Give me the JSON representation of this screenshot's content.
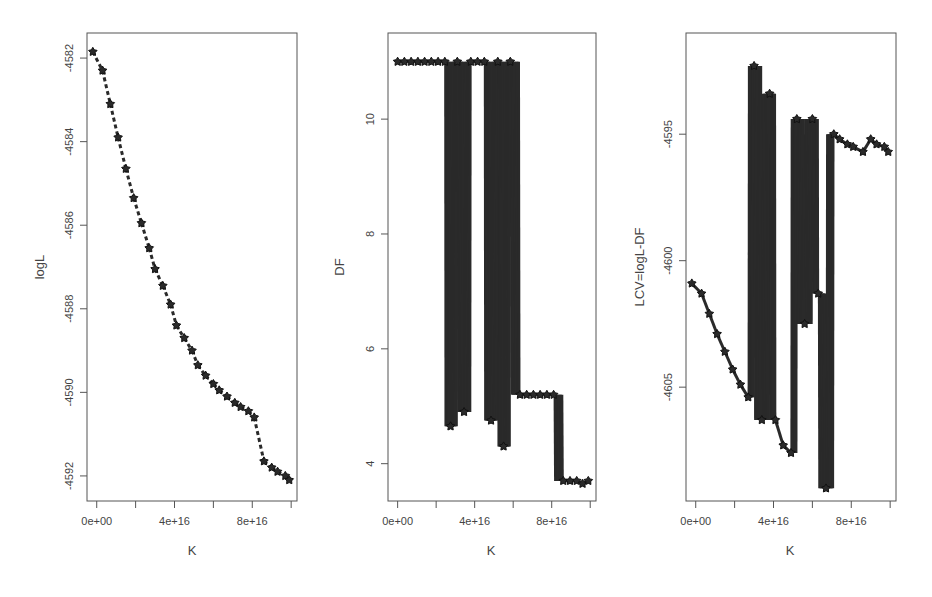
{
  "figure": {
    "background": "#ffffff",
    "line_color": "#2a2a2a",
    "marker_color": "#2a2a2a",
    "frame_color": "#555555"
  },
  "chart_data": [
    {
      "type": "line",
      "panel": "left",
      "title": "",
      "xlabel": "K",
      "ylabel": "logL",
      "x_ticks": [
        0,
        2e+16,
        4e+16,
        6e+16,
        8e+16,
        1e+17
      ],
      "x_tick_labels": [
        "0e+00",
        "",
        "4e+16",
        "",
        "8e+16",
        ""
      ],
      "y_ticks": [
        -4582,
        -4584,
        -4586,
        -4588,
        -4590,
        -4592
      ],
      "y_tick_labels": [
        "-4582",
        "-4584",
        "-4586",
        "-4588",
        "-4590",
        "-4592"
      ],
      "xlim": [
        -5000000000000000.0,
        1.03e+17
      ],
      "ylim": [
        -4592.6,
        -4581.4
      ],
      "grid": false,
      "x": [
        -2000000000000000.0,
        3000000000000000.0,
        7000000000000000.0,
        1.1e+16,
        1.5e+16,
        1.9e+16,
        2.3e+16,
        2.7e+16,
        3e+16,
        3.4e+16,
        3.8e+16,
        4.1e+16,
        4.5e+16,
        4.9e+16,
        5.2e+16,
        5.6e+16,
        6e+16,
        6.3e+16,
        6.7e+16,
        7.1e+16,
        7.4e+16,
        7.8e+16,
        8.1e+16,
        8.6e+16,
        9e+16,
        9.3e+16,
        9.7e+16,
        9.9e+16
      ],
      "y": [
        -4581.85,
        -4582.3,
        -4583.1,
        -4583.9,
        -4584.65,
        -4585.35,
        -4585.95,
        -4586.55,
        -4587.05,
        -4587.45,
        -4587.9,
        -4588.4,
        -4588.7,
        -4589.0,
        -4589.35,
        -4589.6,
        -4589.8,
        -4589.95,
        -4590.1,
        -4590.25,
        -4590.35,
        -4590.45,
        -4590.6,
        -4591.65,
        -4591.8,
        -4591.9,
        -4592.0,
        -4592.1
      ],
      "marker": "star",
      "linestyle": "dashed"
    },
    {
      "type": "line",
      "panel": "middle",
      "title": "",
      "xlabel": "K",
      "ylabel": "DF",
      "x_ticks": [
        0,
        2e+16,
        4e+16,
        6e+16,
        8e+16,
        1e+17
      ],
      "x_tick_labels": [
        "0e+00",
        "",
        "4e+16",
        "",
        "8e+16",
        ""
      ],
      "y_ticks": [
        4,
        6,
        8,
        10
      ],
      "y_tick_labels": [
        "4",
        "6",
        "8",
        "10"
      ],
      "xlim": [
        -5000000000000000.0,
        1.03e+17
      ],
      "ylim": [
        3.35,
        11.5
      ],
      "grid": false,
      "x": [
        0,
        3500000000000000.0,
        7000000000000000.0,
        1.05e+16,
        1.4e+16,
        1.75e+16,
        2.1e+16,
        2.45e+16,
        2.75e+16,
        3.1e+16,
        3.45e+16,
        3.8e+16,
        4.15e+16,
        4.5e+16,
        4.85e+16,
        5.2e+16,
        5.5e+16,
        5.85e+16,
        6.35e+16,
        6.7e+16,
        7.05e+16,
        7.4e+16,
        7.75e+16,
        8.1e+16,
        8.6e+16,
        8.95e+16,
        9.3e+16,
        9.6e+16,
        9.9e+16
      ],
      "y": [
        11.0,
        11.0,
        11.0,
        11.0,
        11.0,
        11.0,
        11.0,
        11.0,
        4.65,
        11.0,
        4.9,
        11.0,
        11.0,
        11.0,
        4.75,
        11.0,
        4.3,
        11.0,
        5.2,
        5.2,
        5.2,
        5.2,
        5.2,
        5.2,
        3.7,
        3.7,
        3.7,
        3.65,
        3.7
      ],
      "marker": "star",
      "linestyle": "solid-oscillating"
    },
    {
      "type": "line",
      "panel": "right",
      "title": "",
      "xlabel": "K",
      "ylabel": "LCV=logL-DF",
      "x_ticks": [
        0,
        2e+16,
        4e+16,
        6e+16,
        8e+16,
        1e+17
      ],
      "x_tick_labels": [
        "0e+00",
        "",
        "4e+16",
        "",
        "8e+16",
        ""
      ],
      "y_ticks": [
        -4595,
        -4600,
        -4605
      ],
      "y_tick_labels": [
        "-4595",
        "-4600",
        "-4605"
      ],
      "xlim": [
        -5000000000000000.0,
        1.03e+17
      ],
      "ylim": [
        -4609.5,
        -4591
      ],
      "grid": false,
      "x": [
        -2000000000000000.0,
        3000000000000000.0,
        7000000000000000.0,
        1.1e+16,
        1.5e+16,
        1.9e+16,
        2.3e+16,
        2.7e+16,
        3e+16,
        3.4e+16,
        3.8e+16,
        4.1e+16,
        4.5e+16,
        4.9e+16,
        5.2e+16,
        5.6e+16,
        6e+16,
        6.3e+16,
        6.7e+16,
        7.1e+16,
        7.4e+16,
        7.8e+16,
        8.1e+16,
        8.6e+16,
        9e+16,
        9.3e+16,
        9.7e+16,
        9.9e+16
      ],
      "y": [
        -4600.9,
        -4601.3,
        -4602.1,
        -4602.9,
        -4603.6,
        -4604.3,
        -4604.9,
        -4605.4,
        -4592.3,
        -4606.3,
        -4593.4,
        -4606.3,
        -4607.3,
        -4607.6,
        -4594.4,
        -4602.5,
        -4594.4,
        -4601.3,
        -4609.0,
        -4595.0,
        -4595.2,
        -4595.4,
        -4595.5,
        -4595.7,
        -4595.2,
        -4595.4,
        -4595.5,
        -4595.7
      ],
      "marker": "star",
      "highlight": {
        "x": 2.7e+16,
        "y": -4592.3,
        "marker": "triangle",
        "note": "maximum LCV"
      },
      "linestyle": "solid-oscillating"
    }
  ]
}
